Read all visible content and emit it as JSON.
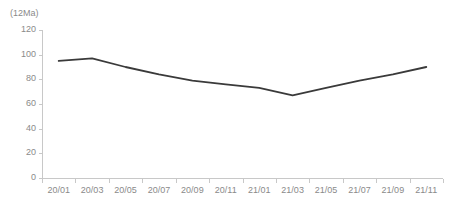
{
  "chart_data": {
    "type": "line",
    "title": "",
    "unit_label": "(12Ma)",
    "xlabel": "",
    "ylabel": "",
    "categories": [
      "20/01",
      "20/03",
      "20/05",
      "20/07",
      "20/09",
      "20/11",
      "21/01",
      "21/03",
      "21/05",
      "21/07",
      "21/09",
      "21/11"
    ],
    "values": [
      95,
      97,
      90,
      84,
      79,
      76,
      73,
      67,
      73,
      79,
      84,
      90
    ],
    "series": [
      {
        "name": "",
        "values": [
          95,
          97,
          90,
          84,
          79,
          76,
          73,
          67,
          73,
          79,
          84,
          90
        ],
        "color": "#3a3a3a"
      }
    ],
    "ylim": [
      0,
      120
    ],
    "yticks": [
      0,
      20,
      40,
      60,
      80,
      100,
      120
    ],
    "ytick_labels": [
      "0",
      "20",
      "40",
      "60",
      "80",
      "100",
      "120"
    ],
    "grid": false,
    "legend": "none",
    "axis_color": "#c8c8c8",
    "tick_label_color": "#8a8a8a"
  }
}
